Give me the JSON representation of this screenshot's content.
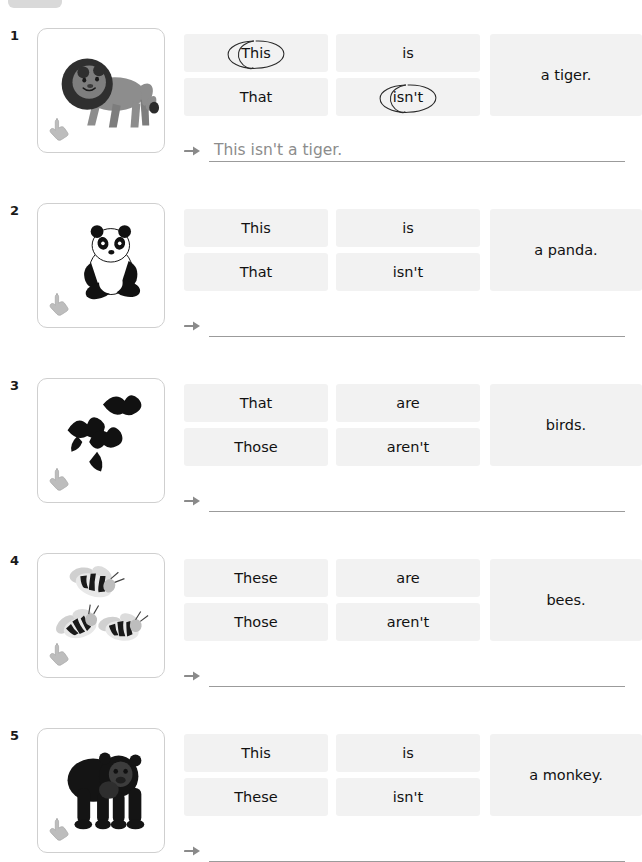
{
  "page": {
    "top_tab_label": "",
    "accent_gray": "#f2f2f2",
    "ink_color": "#111111",
    "answer_ink_color": "#8c8c8c",
    "rule_color": "#9b9b9b"
  },
  "exercises": [
    {
      "number": "1",
      "picture": "lion",
      "picture_alt": "lion",
      "cursor": "pointing-hand",
      "options": {
        "subject_top": "This",
        "subject_bottom": "That",
        "verb_top": "is",
        "verb_bottom": "isn't",
        "predicate": "a tiger."
      },
      "circled": [
        "subject_top",
        "verb_bottom"
      ],
      "answer": "This isn't a tiger."
    },
    {
      "number": "2",
      "picture": "panda",
      "picture_alt": "panda",
      "cursor": "pointing-hand",
      "options": {
        "subject_top": "This",
        "subject_bottom": "That",
        "verb_top": "is",
        "verb_bottom": "isn't",
        "predicate": "a panda."
      },
      "circled": [],
      "answer": ""
    },
    {
      "number": "3",
      "picture": "birds",
      "picture_alt": "birds",
      "cursor": "pointing-hand",
      "options": {
        "subject_top": "That",
        "subject_bottom": "Those",
        "verb_top": "are",
        "verb_bottom": "aren't",
        "predicate": "birds."
      },
      "circled": [],
      "answer": ""
    },
    {
      "number": "4",
      "picture": "bees",
      "picture_alt": "bees",
      "cursor": "pointing-hand",
      "options": {
        "subject_top": "These",
        "subject_bottom": "Those",
        "verb_top": "are",
        "verb_bottom": "aren't",
        "predicate": "bees."
      },
      "circled": [],
      "answer": ""
    },
    {
      "number": "5",
      "picture": "gorilla",
      "picture_alt": "gorilla",
      "cursor": "pointing-hand",
      "options": {
        "subject_top": "This",
        "subject_bottom": "These",
        "verb_top": "is",
        "verb_bottom": "isn't",
        "predicate": "a monkey."
      },
      "circled": [],
      "answer": ""
    }
  ]
}
